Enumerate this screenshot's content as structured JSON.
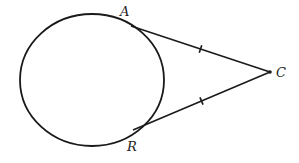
{
  "diagram": {
    "type": "geometry-tangent-segments",
    "stroke_color": "#1a1a1a",
    "background": "#ffffff",
    "circle": {
      "cx": 92,
      "cy": 80,
      "rx": 72,
      "ry": 66
    },
    "points": {
      "A": {
        "label": "A",
        "x": 131,
        "y": 26,
        "label_x": 120,
        "label_y": 16
      },
      "R": {
        "label": "R",
        "x": 133,
        "y": 130,
        "label_x": 127,
        "label_y": 151
      },
      "C": {
        "label": "C",
        "x": 270,
        "y": 72,
        "label_x": 276,
        "label_y": 77
      }
    },
    "segments": [
      {
        "name": "CA",
        "from": "C",
        "to": "A",
        "congruence_ticks": 1
      },
      {
        "name": "CR",
        "from": "C",
        "to": "R",
        "congruence_ticks": 1
      }
    ]
  }
}
